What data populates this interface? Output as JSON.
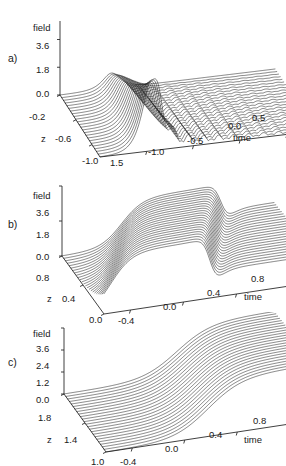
{
  "figure": {
    "background": "#ffffff",
    "line_color": "#1d1d1d",
    "axis_color": "#2b2b2b"
  },
  "panels": [
    {
      "id": "a",
      "label": "a)",
      "vertical_axis_title": "field",
      "vertical_ticks": [
        "3.6",
        "1.8",
        "0.0"
      ],
      "depth_axis_title": "z",
      "depth_ticks": [
        "-0.2",
        "-0.6",
        "-1.0"
      ],
      "horizontal_axis_title": "time",
      "horizontal_ticks": [
        "1.5",
        "-1.0",
        "-0.5",
        "0.0",
        "0.5"
      ]
    },
    {
      "id": "b",
      "label": "b)",
      "vertical_axis_title": "field",
      "vertical_ticks": [
        "3.6",
        "1.8",
        "0.0"
      ],
      "depth_axis_title": "z",
      "depth_ticks": [
        "0.8",
        "0.4",
        "0.0"
      ],
      "horizontal_axis_title": "time",
      "horizontal_ticks": [
        "-0.4",
        "0.0",
        "0.4",
        "0.8"
      ]
    },
    {
      "id": "c",
      "label": "c)",
      "vertical_axis_title": "field",
      "vertical_ticks": [
        "3.6",
        "2.4",
        "1.2",
        "0.0"
      ],
      "depth_axis_title": "z",
      "depth_ticks": [
        "1.8",
        "1.4",
        "1.0"
      ],
      "horizontal_axis_title": "time",
      "horizontal_ticks": [
        "-0.4",
        "0.0",
        "0.4",
        "0.8"
      ]
    }
  ],
  "chart_data": [
    {
      "type": "line",
      "panel": "a",
      "title": "",
      "xlabel": "time",
      "ylabel": "field",
      "zlabel": "z",
      "projection": "3d-waterfall",
      "description": "Sharp soliton-like pulse peaking near field 4.6 followed by a decaying oscillatory (ringing) tail; each curve is a constant-z slice.",
      "xlim": [
        -1.5,
        0.8
      ],
      "ylim": [
        0.0,
        4.8
      ],
      "zlim": [
        -1.0,
        0.0
      ],
      "ytick_values": [
        0.0,
        1.8,
        3.6
      ],
      "xtick_values": [
        -1.0,
        -0.5,
        0.0,
        0.5
      ],
      "ztick_values": [
        -1.0,
        -0.6,
        -0.2
      ],
      "n_curves": 22,
      "grid": false,
      "legend": "none",
      "series": [
        {
          "name": "z=0.00",
          "peak_time": -0.95,
          "peak_field": 4.6,
          "tail": "oscillatory",
          "tail_amplitude": 1.05,
          "tail_period": 0.16
        },
        {
          "name": "z=-0.05",
          "peak_time": -0.95,
          "peak_field": 4.3,
          "tail": "oscillatory",
          "tail_amplitude": 1.0,
          "tail_period": 0.16
        },
        {
          "name": "z=-0.10",
          "peak_time": -0.95,
          "peak_field": 4.0,
          "tail": "oscillatory",
          "tail_amplitude": 0.95,
          "tail_period": 0.16
        },
        {
          "name": "z=-0.15",
          "peak_time": -0.95,
          "peak_field": 3.72,
          "tail": "oscillatory",
          "tail_amplitude": 0.9,
          "tail_period": 0.16
        },
        {
          "name": "z=-0.20",
          "peak_time": -0.95,
          "peak_field": 3.45,
          "tail": "oscillatory",
          "tail_amplitude": 0.85,
          "tail_period": 0.16
        },
        {
          "name": "z=-0.30",
          "peak_time": -0.95,
          "peak_field": 3.05,
          "tail": "oscillatory",
          "tail_amplitude": 0.78,
          "tail_period": 0.16
        },
        {
          "name": "z=-0.40",
          "peak_time": -0.95,
          "peak_field": 2.7,
          "tail": "oscillatory",
          "tail_amplitude": 0.7,
          "tail_period": 0.16
        },
        {
          "name": "z=-0.50",
          "peak_time": -0.95,
          "peak_field": 2.4,
          "tail": "oscillatory",
          "tail_amplitude": 0.62,
          "tail_period": 0.16
        },
        {
          "name": "z=-0.60",
          "peak_time": -0.95,
          "peak_field": 2.1,
          "tail": "oscillatory",
          "tail_amplitude": 0.54,
          "tail_period": 0.16
        },
        {
          "name": "z=-0.70",
          "peak_time": -0.95,
          "peak_field": 1.82,
          "tail": "oscillatory",
          "tail_amplitude": 0.46,
          "tail_period": 0.16
        },
        {
          "name": "z=-0.80",
          "peak_time": -0.95,
          "peak_field": 1.55,
          "tail": "oscillatory",
          "tail_amplitude": 0.36,
          "tail_period": 0.16
        },
        {
          "name": "z=-0.90",
          "peak_time": -0.95,
          "peak_field": 1.28,
          "tail": "oscillatory",
          "tail_amplitude": 0.24,
          "tail_period": 0.16
        },
        {
          "name": "z=-1.00",
          "peak_time": -0.95,
          "peak_field": 1.02,
          "tail": "flat",
          "tail_amplitude": 0.0,
          "tail_period": 0.16
        }
      ]
    },
    {
      "type": "line",
      "panel": "b",
      "title": "",
      "xlabel": "time",
      "ylabel": "field",
      "zlabel": "z",
      "projection": "3d-waterfall",
      "description": "Smooth monotonic front rising to a plateau near field 2.6-3.0 with a steep trailing edge; curves flatten and shift with increasing z.",
      "xlim": [
        -0.6,
        1.0
      ],
      "ylim": [
        0.0,
        3.6
      ],
      "zlim": [
        0.0,
        0.8
      ],
      "ytick_values": [
        0.0,
        1.8,
        3.6
      ],
      "xtick_values": [
        -0.4,
        0.0,
        0.4,
        0.8
      ],
      "ztick_values": [
        0.0,
        0.4,
        0.8
      ],
      "n_curves": 22,
      "grid": false,
      "legend": "none",
      "series": [
        {
          "name": "z=0.80",
          "plateau_field": 3.0,
          "front_time": -0.1,
          "front_width": 0.3
        },
        {
          "name": "z=0.70",
          "plateau_field": 2.95,
          "front_time": -0.05,
          "front_width": 0.3
        },
        {
          "name": "z=0.60",
          "plateau_field": 2.88,
          "front_time": 0.0,
          "front_width": 0.3
        },
        {
          "name": "z=0.50",
          "plateau_field": 2.8,
          "front_time": 0.05,
          "front_width": 0.3
        },
        {
          "name": "z=0.40",
          "plateau_field": 2.72,
          "front_time": 0.1,
          "front_width": 0.3
        },
        {
          "name": "z=0.30",
          "plateau_field": 2.64,
          "front_time": 0.15,
          "front_width": 0.3
        },
        {
          "name": "z=0.20",
          "plateau_field": 2.56,
          "front_time": 0.2,
          "front_width": 0.3
        },
        {
          "name": "z=0.10",
          "plateau_field": 2.48,
          "front_time": 0.25,
          "front_width": 0.3
        },
        {
          "name": "z=0.00",
          "plateau_field": 2.4,
          "front_time": 0.3,
          "front_width": 0.3
        }
      ]
    },
    {
      "type": "line",
      "panel": "c",
      "title": "",
      "xlabel": "time",
      "ylabel": "field",
      "zlabel": "z",
      "projection": "3d-waterfall",
      "description": "Smooth monotonic kink ramp rising from 0 to about 3.0; the transition sharpens and the curves bunch together at larger time.",
      "xlim": [
        -0.6,
        1.0
      ],
      "ylim": [
        0.0,
        3.6
      ],
      "zlim": [
        1.0,
        1.8
      ],
      "ytick_values": [
        0.0,
        1.2,
        2.4,
        3.6
      ],
      "xtick_values": [
        -0.4,
        0.0,
        0.4,
        0.8
      ],
      "ztick_values": [
        1.0,
        1.4,
        1.8
      ],
      "n_curves": 22,
      "grid": false,
      "legend": "none",
      "series": [
        {
          "name": "z=1.80",
          "plateau_field": 3.05,
          "front_time": 0.18,
          "front_width": 0.26
        },
        {
          "name": "z=1.70",
          "plateau_field": 3.02,
          "front_time": 0.19,
          "front_width": 0.26
        },
        {
          "name": "z=1.60",
          "plateau_field": 3.0,
          "front_time": 0.2,
          "front_width": 0.26
        },
        {
          "name": "z=1.50",
          "plateau_field": 2.96,
          "front_time": 0.21,
          "front_width": 0.26
        },
        {
          "name": "z=1.40",
          "plateau_field": 2.92,
          "front_time": 0.22,
          "front_width": 0.26
        },
        {
          "name": "z=1.30",
          "plateau_field": 2.88,
          "front_time": 0.23,
          "front_width": 0.26
        },
        {
          "name": "z=1.20",
          "plateau_field": 2.84,
          "front_time": 0.24,
          "front_width": 0.26
        },
        {
          "name": "z=1.10",
          "plateau_field": 2.8,
          "front_time": 0.25,
          "front_width": 0.26
        },
        {
          "name": "z=1.00",
          "plateau_field": 2.76,
          "front_time": 0.26,
          "front_width": 0.26
        }
      ]
    }
  ]
}
